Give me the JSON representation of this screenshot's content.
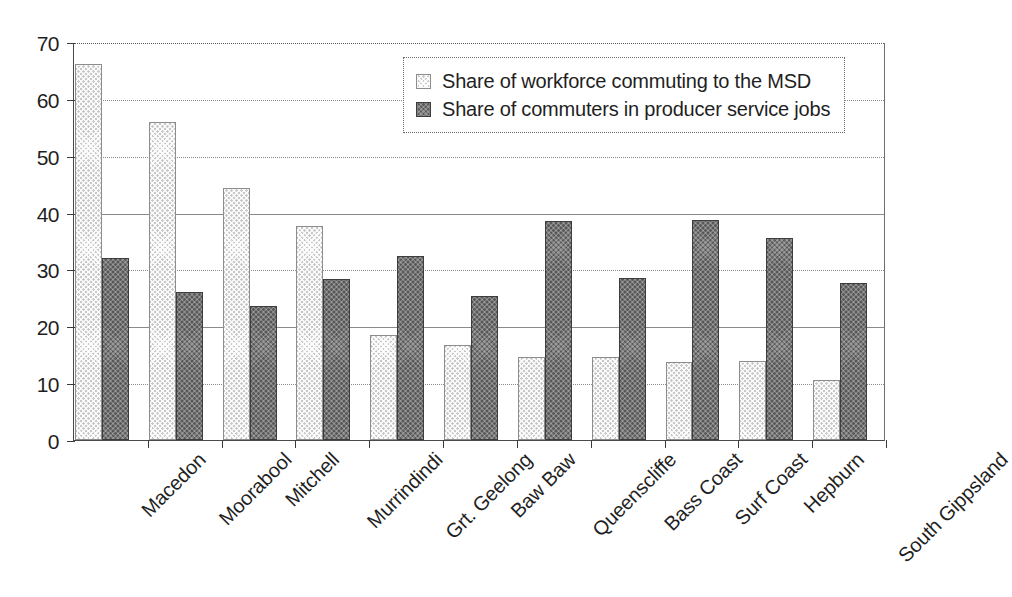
{
  "chart_data": {
    "type": "bar",
    "title": "",
    "subtitle": "",
    "xlabel": "",
    "ylabel": "",
    "ylim": [
      0,
      70
    ],
    "ytick_step": 10,
    "yticks": [
      0,
      10,
      20,
      30,
      40,
      50,
      60,
      70
    ],
    "grid": true,
    "grid_axis": "y",
    "grid_style": "dotted",
    "legend_position": "top-center-right",
    "orientation": "vertical",
    "categories": [
      "Macedon",
      "Moorabool",
      "Mitchell",
      "Murrindindi",
      "Grt. Geelong",
      "Baw Baw",
      "Queenscliffe",
      "Bass Coast",
      "Surf Coast",
      "Hepburn",
      "South Gippsland"
    ],
    "series": [
      {
        "name": "Share of workforce commuting to the MSD",
        "color": "#c9c9c9",
        "values": [
          66.2,
          56.0,
          44.4,
          37.6,
          18.4,
          16.7,
          14.6,
          14.6,
          13.8,
          13.9,
          10.5
        ]
      },
      {
        "name": "Share of commuters in producer service jobs",
        "color": "#585858",
        "values": [
          32.0,
          26.0,
          23.5,
          28.4,
          32.3,
          25.4,
          38.6,
          28.5,
          38.7,
          35.6,
          27.6
        ]
      }
    ]
  },
  "axes": {
    "y_tick_labels": [
      "70",
      "60",
      "50",
      "40",
      "30",
      "20",
      "10",
      "0"
    ]
  },
  "legend": {
    "items": [
      {
        "label": "Share of workforce commuting to the MSD",
        "swatch": "light"
      },
      {
        "label": "Share of commuters in producer service jobs",
        "swatch": "dark"
      }
    ]
  }
}
